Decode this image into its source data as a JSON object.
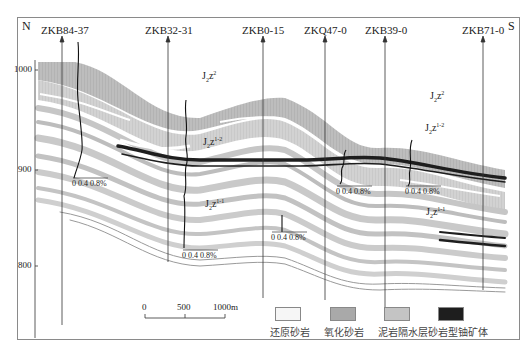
{
  "orientation": {
    "left": "N",
    "right": "S"
  },
  "wells": [
    {
      "id": "ZKB84-37",
      "x": 62
    },
    {
      "id": "ZKB32-31",
      "x": 168
    },
    {
      "id": "ZKB0-15",
      "x": 263
    },
    {
      "id": "ZKQ47-0",
      "x": 325
    },
    {
      "id": "ZKB39-0",
      "x": 385
    },
    {
      "id": "ZKB71-0",
      "x": 483
    }
  ],
  "elevation_axis": {
    "ticks": [
      "1000",
      "900",
      "800"
    ]
  },
  "grade_scale_label": "0  0.4  0.8%",
  "grade_scale": {
    "t0": "0",
    "t1": "0.4",
    "t2": "0.8%"
  },
  "strata_units": {
    "upper": {
      "base": "J",
      "sub": "2",
      "mid": "z",
      "sup": "2"
    },
    "middle": {
      "base": "J",
      "sub": "2",
      "mid": "z",
      "sup": "1-2"
    },
    "lower": {
      "base": "J",
      "sub": "2",
      "mid": "z",
      "sup": "1-1"
    }
  },
  "scale_bar": {
    "ticks": [
      "0",
      "500",
      "1000m"
    ]
  },
  "legend": [
    {
      "label": "还原砂岩",
      "color": "#f6f6f6"
    },
    {
      "label": "氧化砂岩",
      "color": "#a9a9a9"
    },
    {
      "label": "泥岩隔水层",
      "color": "#c4c4c4"
    },
    {
      "label": "砂岩型铀矿体",
      "color": "#1e1e1e"
    }
  ],
  "colors": {
    "oxidized": "#b4b4b4",
    "mudstone": "#cfcfcf",
    "ore": "#1e1e1e",
    "frame": "#8a8a8a"
  }
}
